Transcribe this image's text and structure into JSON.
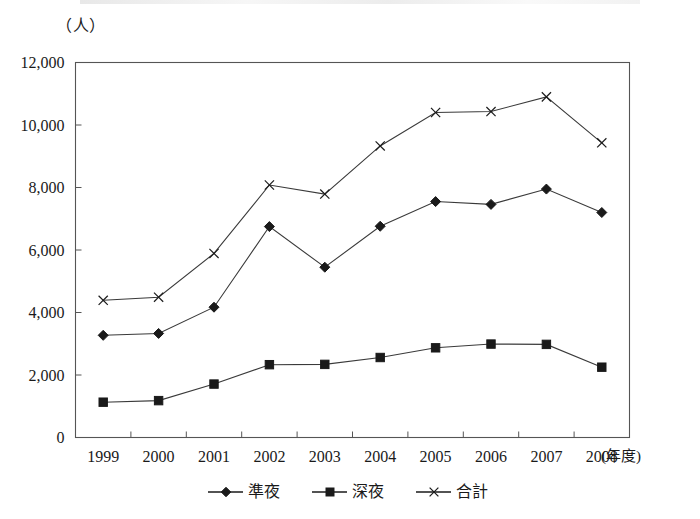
{
  "chart_data": {
    "type": "line",
    "title": "",
    "xlabel": "(年度)",
    "ylabel": "（人）",
    "unit_label": "（人）",
    "x_unit_suffix": "(年度)",
    "categories": [
      "1999",
      "2000",
      "2001",
      "2002",
      "2003",
      "2004",
      "2005",
      "2006",
      "2007",
      "2008"
    ],
    "ylim": [
      0,
      12000
    ],
    "ytick_labels": [
      "0",
      "2,000",
      "4,000",
      "6,000",
      "8,000",
      "10,000",
      "12,000"
    ],
    "ytick_values": [
      0,
      2000,
      4000,
      6000,
      8000,
      10000,
      12000
    ],
    "grid": false,
    "legend_position": "bottom",
    "series": [
      {
        "name": "準夜",
        "marker": "diamond",
        "values": [
          3270,
          3330,
          4170,
          6750,
          5450,
          6760,
          7550,
          7460,
          7950,
          7200
        ]
      },
      {
        "name": "深夜",
        "marker": "square",
        "values": [
          1130,
          1180,
          1710,
          2330,
          2340,
          2560,
          2870,
          2990,
          2980,
          2250
        ]
      },
      {
        "name": "合計",
        "marker": "cross",
        "values": [
          4390,
          4490,
          5890,
          8080,
          7790,
          9330,
          10400,
          10430,
          10900,
          9430
        ]
      }
    ]
  },
  "legend": {
    "items": [
      {
        "label": "準夜",
        "marker": "diamond"
      },
      {
        "label": "深夜",
        "marker": "square"
      },
      {
        "label": "合計",
        "marker": "cross"
      }
    ]
  },
  "colors": {
    "line": "#3a3a3a",
    "frame": "#555555",
    "text": "#1a1a1a",
    "background": "#ffffff"
  }
}
